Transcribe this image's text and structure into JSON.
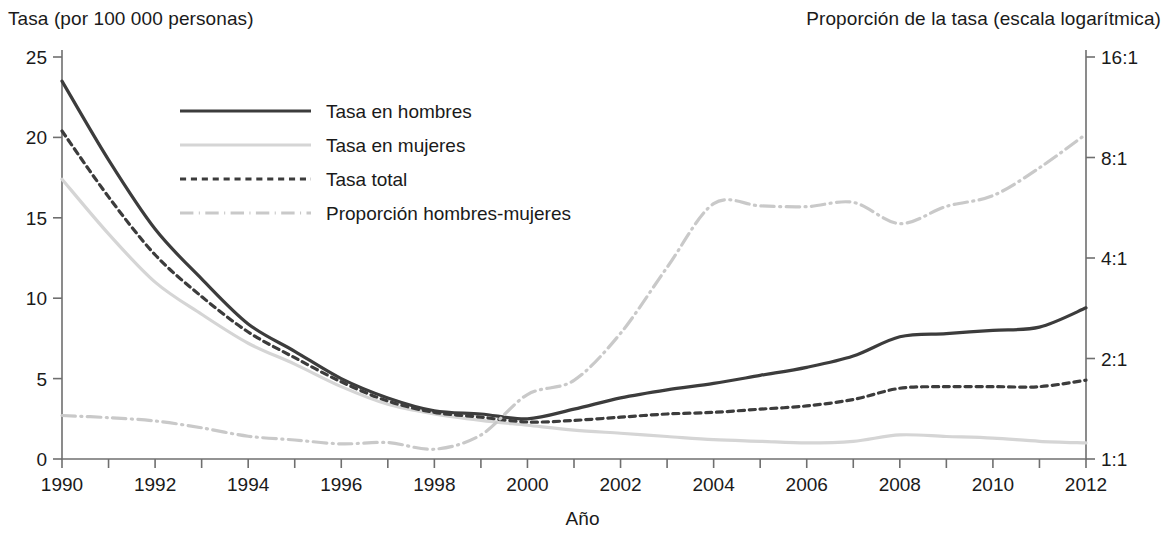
{
  "labels": {
    "left_axis_title": "Tasa (por 100 000 personas)",
    "right_axis_title": "Proporción de la tasa (escala logarítmica)",
    "x_axis_title": "Año"
  },
  "colors": {
    "dark_line": "#3c3c3c",
    "light_line": "#d5d5d5",
    "axis": "#6f6f6f",
    "text": "#1a1a1a"
  },
  "chart_data": {
    "type": "line",
    "title": "",
    "xlabel": "Año",
    "ylabel": "Tasa (por 100 000 personas)",
    "y2label": "Proporción de la tasa (escala logarítmica)",
    "grid": false,
    "legend_position": "top-left inside",
    "xlim": [
      1990,
      2012
    ],
    "ylim": [
      0,
      25
    ],
    "y2lim": [
      1,
      16
    ],
    "y2_scale": "log2",
    "xticks": [
      1990,
      1991,
      1992,
      1993,
      1994,
      1995,
      1996,
      1997,
      1998,
      1999,
      2000,
      2001,
      2002,
      2003,
      2004,
      2005,
      2006,
      2007,
      2008,
      2009,
      2010,
      2011,
      2012
    ],
    "xtick_labels": [
      "1990",
      "",
      "1992",
      "",
      "1994",
      "",
      "1996",
      "",
      "1998",
      "",
      "2000",
      "",
      "2002",
      "",
      "2004",
      "",
      "2006",
      "",
      "2008",
      "",
      "2010",
      "",
      "2012"
    ],
    "yticks": [
      0,
      5,
      10,
      15,
      20,
      25
    ],
    "ytick_labels": [
      "0",
      "5",
      "10",
      "15",
      "20",
      "25"
    ],
    "y2ticks": [
      1,
      2,
      4,
      8,
      16
    ],
    "y2tick_labels": [
      "1:1",
      "2:1",
      "4:1",
      "8:1",
      "16:1"
    ],
    "x": [
      1990,
      1991,
      1992,
      1993,
      1994,
      1995,
      1996,
      1997,
      1998,
      1999,
      2000,
      2001,
      2002,
      2003,
      2004,
      2005,
      2006,
      2007,
      2008,
      2009,
      2010,
      2011,
      2012
    ],
    "series": [
      {
        "name": "Tasa en hombres",
        "axis": "left",
        "style": "solid",
        "color": "#3c3c3c",
        "width": 3.2,
        "values": [
          23.5,
          18.6,
          14.3,
          11.2,
          8.4,
          6.7,
          5.0,
          3.8,
          3.0,
          2.8,
          2.5,
          3.1,
          3.8,
          4.3,
          4.7,
          5.2,
          5.7,
          6.4,
          7.6,
          7.8,
          8.0,
          8.2,
          9.4
        ]
      },
      {
        "name": "Tasa en mujeres",
        "axis": "left",
        "style": "solid",
        "color": "#d5d5d5",
        "width": 3.2,
        "values": [
          17.4,
          14.0,
          11.0,
          9.0,
          7.2,
          5.9,
          4.5,
          3.4,
          2.8,
          2.4,
          2.1,
          1.8,
          1.6,
          1.4,
          1.2,
          1.1,
          1.0,
          1.1,
          1.5,
          1.4,
          1.3,
          1.1,
          1.0
        ]
      },
      {
        "name": "Tasa total",
        "axis": "left",
        "style": "dashed",
        "color": "#3c3c3c",
        "width": 3.2,
        "values": [
          20.4,
          16.3,
          12.7,
          10.1,
          7.9,
          6.3,
          4.8,
          3.6,
          2.9,
          2.6,
          2.3,
          2.4,
          2.6,
          2.8,
          2.9,
          3.1,
          3.3,
          3.7,
          4.4,
          4.5,
          4.5,
          4.5,
          4.9
        ]
      },
      {
        "name": "Proporción hombres-mujeres",
        "axis": "right",
        "style": "dashdot",
        "color": "#c9c9c9",
        "width": 3.2,
        "values": [
          1.35,
          1.33,
          1.3,
          1.24,
          1.17,
          1.14,
          1.11,
          1.12,
          1.07,
          1.18,
          1.56,
          1.72,
          2.38,
          3.75,
          5.82,
          5.73,
          5.7,
          5.87,
          5.07,
          5.71,
          6.15,
          7.45,
          9.4
        ]
      }
    ]
  },
  "legend": {
    "entries": [
      {
        "label": "Tasa en hombres",
        "style": "solid",
        "color": "#3c3c3c"
      },
      {
        "label": "Tasa en mujeres",
        "style": "solid",
        "color": "#d5d5d5"
      },
      {
        "label": "Tasa total",
        "style": "dashed",
        "color": "#3c3c3c"
      },
      {
        "label": "Proporción hombres-mujeres",
        "style": "dashdot",
        "color": "#c9c9c9"
      }
    ]
  }
}
